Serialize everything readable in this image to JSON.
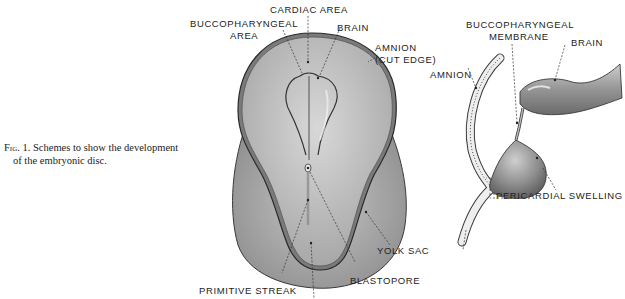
{
  "caption": {
    "fig_label": "Fig. 1.",
    "line1": "Schemes to show the development",
    "line2": "of the embryonic disc."
  },
  "left_diagram": {
    "labels": {
      "cardiac_area": "CARDIAC AREA",
      "buccopharyngeal_area_1": "BUCCOPHARYNGEAL",
      "buccopharyngeal_area_2": "AREA",
      "brain": "BRAIN",
      "amnion_1": "AMNION",
      "amnion_2": "(CUT EDGE)",
      "yolk_sac": "YOLK SAC",
      "blastopore": "BLASTOPORE",
      "primitive_streak": "PRIMITIVE STREAK"
    }
  },
  "right_diagram": {
    "labels": {
      "buccopharyngeal_membrane_1": "BUCCOPHARYNGEAL",
      "buccopharyngeal_membrane_2": "MEMBRANE",
      "brain": "BRAIN",
      "amnion": "AMNION",
      "pericardial_swelling": "PERICARDIAL SWELLING"
    }
  },
  "colors": {
    "disc_fill": "#bdbdbd",
    "yolk_fill": "#a9a9a9",
    "outline": "#3a3a3a",
    "text": "#222222"
  }
}
